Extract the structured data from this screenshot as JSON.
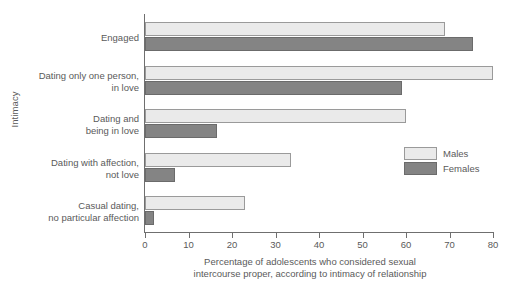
{
  "chart_data": {
    "type": "bar",
    "orientation": "horizontal",
    "title": "",
    "xlabel": "Percentage of adolescents who considered sexual intercourse proper, according to intimacy of relationship",
    "xlabel_lines": [
      "Percentage of adolescents who considered sexual",
      "intercourse proper, according to intimacy of relationship"
    ],
    "ylabel": "Intimacy",
    "xlim": [
      0,
      80
    ],
    "xticks": [
      0,
      10,
      20,
      30,
      40,
      50,
      60,
      70,
      80
    ],
    "xtick_labels": [
      "0",
      "10",
      "20",
      "30",
      "40",
      "50",
      "60",
      "70",
      "80"
    ],
    "grid": false,
    "legend_position": "right-middle",
    "categories": [
      "Engaged",
      "Dating only one person,\nin love",
      "Dating and\nbeing in love",
      "Dating with affection,\nnot love",
      "Casual dating,\nno particular affection"
    ],
    "series": [
      {
        "name": "Males",
        "color": "#eaeaea",
        "values": [
          69,
          80,
          60,
          33.5,
          23
        ]
      },
      {
        "name": "Females",
        "color": "#848484",
        "values": [
          75.5,
          59,
          16.5,
          7,
          2
        ]
      }
    ]
  },
  "legend": {
    "items": [
      {
        "label": "Males"
      },
      {
        "label": "Females"
      }
    ]
  },
  "axis": {
    "y_title": "Intimacy"
  }
}
